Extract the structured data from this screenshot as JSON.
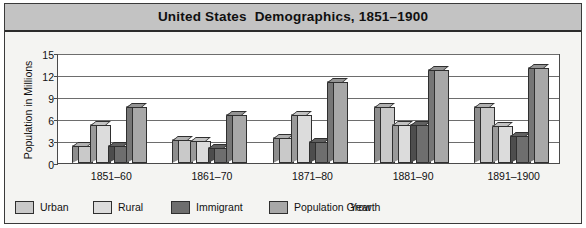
{
  "chart_data": {
    "type": "bar",
    "title": "United States  Demographics, 1851–1900",
    "xlabel": "Year",
    "ylabel": "Population in Millions",
    "categories": [
      "1851–60",
      "1861–70",
      "1871–80",
      "1881–90",
      "1891–1900"
    ],
    "series": [
      {
        "name": "Urban",
        "values": [
          2.3,
          3.1,
          3.4,
          7.6,
          7.6
        ],
        "color": "#c9c9c9"
      },
      {
        "name": "Rural",
        "values": [
          5.2,
          3.0,
          6.5,
          5.2,
          5.0
        ],
        "color": "#dcdcdc"
      },
      {
        "name": "Immigrant",
        "values": [
          2.3,
          2.1,
          2.8,
          5.2,
          3.7
        ],
        "color": "#6e6e6e"
      },
      {
        "name": "Population Growth",
        "values": [
          7.7,
          6.5,
          11.0,
          12.7,
          13.0
        ],
        "color": "#a8a8a8"
      }
    ],
    "ylim": [
      0,
      15
    ],
    "yticks": [
      0,
      3,
      6,
      9,
      12,
      15
    ],
    "ytick_labels": [
      "0",
      "3",
      "6",
      "9",
      "12",
      "15"
    ],
    "grid": true,
    "legend_position": "bottom-left",
    "style": "3d-bars"
  },
  "colors": {
    "title_banner": "#c3c3c3",
    "frame_border": "#3a3a3a",
    "plot_background": "#ffffff",
    "panel_background": "#f4f4f2",
    "gridline": "#6d6d6d",
    "bar_outline": "#2f2f2f"
  }
}
